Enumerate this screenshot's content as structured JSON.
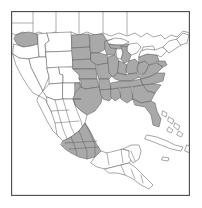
{
  "figure": {
    "width": 202,
    "height": 208
  },
  "frame": {
    "name": "map-border",
    "stroke_color": "#4a4a4a",
    "background_color": "#ffffff"
  },
  "legend_colors": {
    "shaded_range_fill": "#a9a9a9",
    "unshaded_fill": "#ffffff",
    "boundary_line": "#5d5d5d",
    "coastline": "#4f4f4f"
  },
  "regions": {
    "shaded_label": "Range (shaded)",
    "unshaded_label": "Outside range",
    "shaded_areas": [
      "Washington",
      "North Dakota",
      "South Dakota",
      "Nebraska",
      "Kansas",
      "Oklahoma",
      "Texas",
      "Minnesota",
      "Iowa",
      "Missouri",
      "Arkansas",
      "Louisiana",
      "Wisconsin",
      "Illinois",
      "Mississippi",
      "Michigan",
      "Indiana",
      "Kentucky",
      "Tennessee",
      "Alabama",
      "Ohio",
      "West Virginia",
      "Virginia",
      "North Carolina",
      "South Carolina",
      "Georgia",
      "Florida",
      "Pennsylvania",
      "New York",
      "Maryland",
      "New Jersey",
      "eastern New Mexico",
      "central Mexico highlands"
    ],
    "unshaded_areas": [
      "Canada",
      "Oregon",
      "California",
      "Idaho",
      "Nevada",
      "Utah",
      "Arizona",
      "Montana",
      "Wyoming",
      "Colorado",
      "New England",
      "Great Lakes",
      "northern Mexico",
      "Baja California",
      "Yucatan",
      "Central America",
      "Cuba",
      "Bahamas"
    ]
  }
}
